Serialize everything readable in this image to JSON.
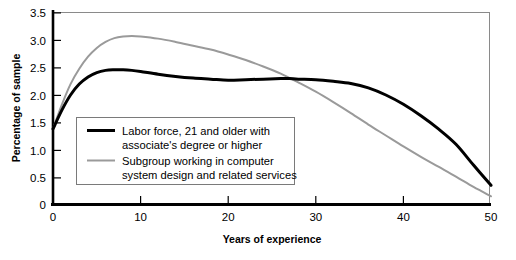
{
  "chart_data": {
    "type": "line",
    "title": "",
    "xlabel": "Years of experience",
    "ylabel": "Percentage of sample",
    "xlim": [
      0,
      50
    ],
    "ylim": [
      0,
      3.5
    ],
    "xticks": [
      "0",
      "10",
      "20",
      "30",
      "40",
      "50"
    ],
    "xtick_values": [
      0,
      10,
      20,
      30,
      40,
      50
    ],
    "yticks": [
      "0",
      "0.5",
      "1.0",
      "1.5",
      "2.0",
      "2.5",
      "3.0",
      "3.5"
    ],
    "ytick_values": [
      0,
      0.5,
      1.0,
      1.5,
      2.0,
      2.5,
      3.0,
      3.5
    ],
    "grid": false,
    "legend_position": "center-left-inside",
    "x": [
      0,
      1,
      2,
      3,
      4,
      5,
      6,
      7,
      8,
      9,
      10,
      12,
      14,
      16,
      18,
      20,
      22,
      24,
      26,
      27,
      28,
      30,
      32,
      34,
      36,
      38,
      40,
      42,
      44,
      46,
      48,
      50
    ],
    "series": [
      {
        "name": "Labor force, 21 and older with associate's degree or higher",
        "color": "#000000",
        "line_width": 3.0,
        "values": [
          1.38,
          1.72,
          2.0,
          2.2,
          2.33,
          2.41,
          2.45,
          2.46,
          2.46,
          2.45,
          2.43,
          2.38,
          2.34,
          2.31,
          2.29,
          2.27,
          2.28,
          2.29,
          2.3,
          2.3,
          2.29,
          2.28,
          2.25,
          2.21,
          2.13,
          2.0,
          1.83,
          1.62,
          1.38,
          1.1,
          0.72,
          0.35
        ]
      },
      {
        "name": "Subgroup working in computer system design and related services",
        "color": "#9a9a9a",
        "line_width": 2.0,
        "values": [
          1.38,
          1.82,
          2.2,
          2.48,
          2.7,
          2.86,
          2.97,
          3.04,
          3.07,
          3.08,
          3.07,
          3.03,
          2.97,
          2.9,
          2.83,
          2.74,
          2.64,
          2.52,
          2.39,
          2.31,
          2.23,
          2.06,
          1.87,
          1.67,
          1.46,
          1.26,
          1.06,
          0.87,
          0.69,
          0.51,
          0.32,
          0.15
        ]
      }
    ],
    "legend": [
      {
        "line1": "Labor force, 21 and older with",
        "line2": "associate's degree or higher",
        "color": "#000000",
        "swatch_width": 3.0
      },
      {
        "line1": "Subgroup working in computer",
        "line2": "system design and related services",
        "color": "#9a9a9a",
        "swatch_width": 2.0
      }
    ]
  },
  "colors": {
    "axis": "#000000",
    "frame": "#808080",
    "background": "#ffffff",
    "legend_border": "#7a7a7a",
    "series_primary": "#000000",
    "series_secondary": "#9a9a9a"
  }
}
